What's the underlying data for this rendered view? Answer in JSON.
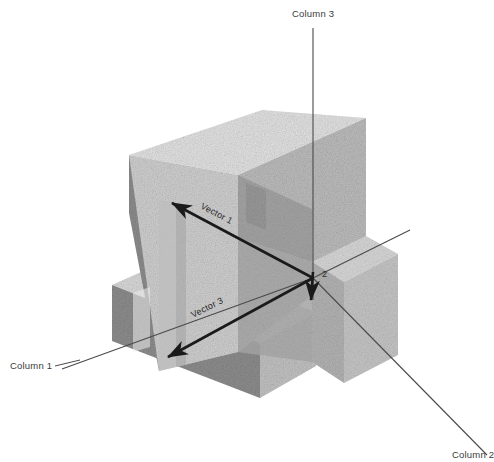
{
  "figure": {
    "background_color": "#ffffff",
    "axes": [
      {
        "id": "column-1",
        "label": "Column 1",
        "label_x": 10,
        "label_y": 369,
        "direction": "lower-left"
      },
      {
        "id": "column-2",
        "label": "Column 2",
        "label_x": 452,
        "label_y": 458,
        "direction": "lower-right"
      },
      {
        "id": "column-3",
        "label": "Column 3",
        "label_x": 292,
        "label_y": 17,
        "direction": "up"
      }
    ],
    "vectors": [
      {
        "id": "vector-1",
        "label": "Vector 1",
        "label_x": 200,
        "label_y": 208,
        "rotation": 28,
        "color": "#1a1a1a"
      },
      {
        "id": "vector-2",
        "label": "2",
        "label_x": 322,
        "label_y": 277,
        "rotation": 0,
        "color": "#1a1a1a"
      },
      {
        "id": "vector-3",
        "label": "Vector 3",
        "label_x": 193,
        "label_y": 318,
        "rotation": -27,
        "color": "#1a1a1a"
      }
    ],
    "origin": {
      "x": 313,
      "y": 278
    },
    "colors": {
      "top_face": "#dedede",
      "front_face": "#c9c9c9",
      "right_face": "#b6b6b6",
      "left_face": "#8d8d8d",
      "shadow_face": "#9a9a9a",
      "axis": "#4a4a4a",
      "vector": "#1a1a1a",
      "text": "#3b3b3b"
    }
  }
}
